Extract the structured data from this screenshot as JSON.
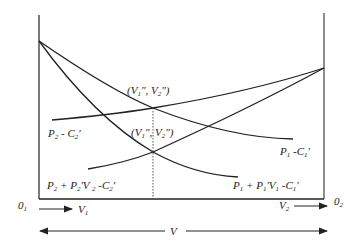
{
  "diagram": {
    "type": "two-sided optimality diagram",
    "origins": {
      "left": "0",
      "left_sub": "1",
      "right": "0",
      "right_sub": "2"
    },
    "axis_labels": {
      "v1": {
        "base": "V",
        "sub": "1"
      },
      "v2": {
        "base": "V",
        "sub": "2"
      },
      "total": "V"
    },
    "curves": [
      {
        "id": "p1-c1",
        "label_parts": [
          [
            "P",
            "1"
          ],
          [
            " -C",
            "1"
          ],
          [
            "′",
            ""
          ]
        ],
        "label_text": "P1 -C1′",
        "description": "decreasing from left axis"
      },
      {
        "id": "p1-plus",
        "label_parts": [
          [
            "P",
            "1"
          ],
          [
            " + P",
            "1"
          ],
          [
            "′V",
            "1"
          ],
          [
            " -C",
            "1"
          ],
          [
            "′",
            ""
          ]
        ],
        "label_text": "P1 + P1′V1 -C1′",
        "description": "steeper decreasing from left axis"
      },
      {
        "id": "p2-c2",
        "label_parts": [
          [
            "P",
            "2"
          ],
          [
            " - C",
            "2"
          ],
          [
            "′",
            ""
          ]
        ],
        "label_text": "P2 - C2′",
        "description": "increasing to right axis"
      },
      {
        "id": "p2-plus",
        "label_parts": [
          [
            "P",
            "2"
          ],
          [
            " + P",
            "2"
          ],
          [
            "′V ",
            "2"
          ],
          [
            " -C",
            "2"
          ],
          [
            "′",
            ""
          ]
        ],
        "label_text": "P2 + P2′V2 -C2′",
        "description": "steeper increasing to right axis"
      }
    ],
    "intersections": [
      {
        "id": "upper",
        "label_parts": [
          [
            "(V",
            "1"
          ],
          [
            "″, V",
            "2"
          ],
          [
            "″)",
            ""
          ]
        ],
        "label_text": "(V1″, V2″)"
      },
      {
        "id": "lower",
        "label_parts": [
          [
            "(V",
            "1"
          ],
          [
            "″, V",
            "2"
          ],
          [
            "″)",
            ""
          ]
        ],
        "label_text": "(V1″, V2″)"
      }
    ],
    "line_color": "#222222",
    "background": "#ffffff"
  }
}
